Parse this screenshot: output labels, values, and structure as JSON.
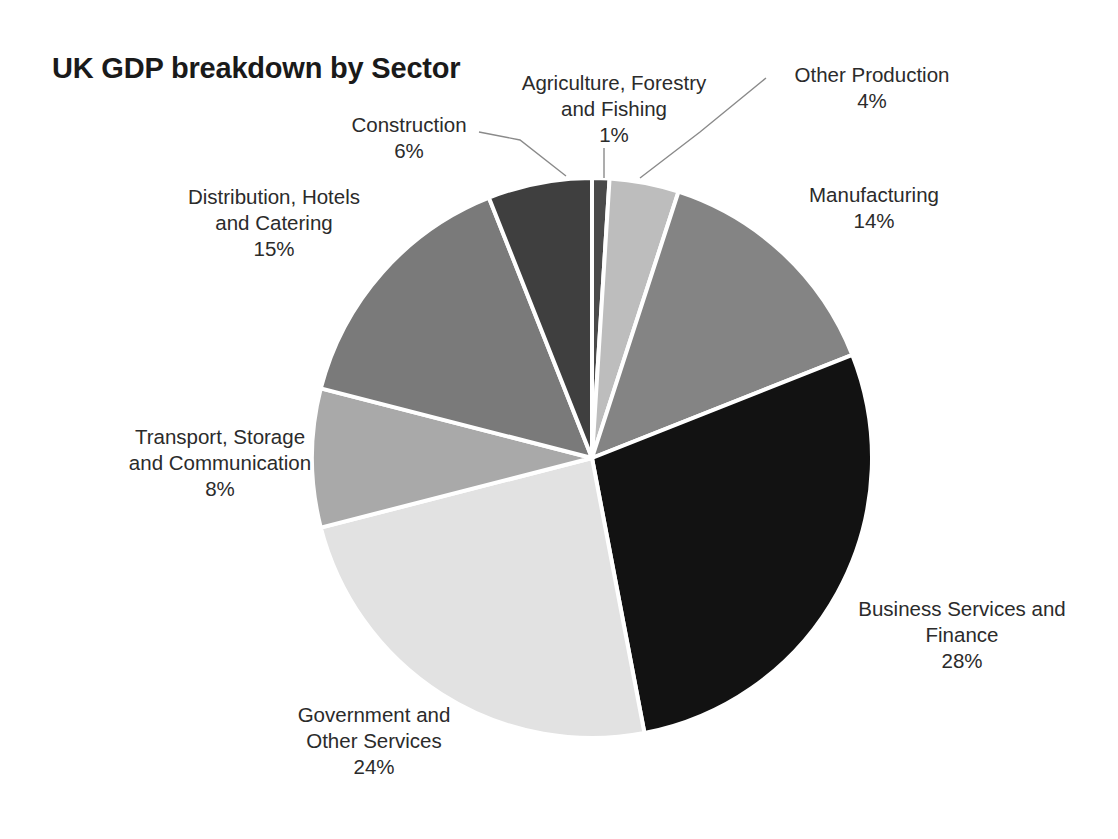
{
  "chart_data": {
    "type": "pie",
    "title": "UK GDP breakdown by Sector",
    "xlabel": "",
    "ylabel": "",
    "legend": "none",
    "grid": false,
    "units": "percent",
    "label_format": "name + percent",
    "start_angle_deg": 0,
    "direction": "clockwise",
    "center": {
      "x": 592,
      "y": 458
    },
    "radius": 280,
    "slice_gap_color": "#ffffff",
    "categories": [
      "Agriculture, Forestry and Fishing",
      "Other Production",
      "Manufacturing",
      "Business Services and Finance",
      "Government and Other Services",
      "Transport, Storage and Communication",
      "Distribution, Hotels and Catering",
      "Construction"
    ],
    "values": [
      1,
      4,
      14,
      28,
      24,
      8,
      15,
      6
    ],
    "colors": [
      "#4a4a4a",
      "#bdbdbd",
      "#848484",
      "#121212",
      "#e2e2e2",
      "#a9a9a9",
      "#7a7a7a",
      "#3f3f3f"
    ],
    "slices": [
      {
        "key": "agriculture",
        "name_line1": "Agriculture, Forestry",
        "name_line2": "and Fishing",
        "value": 1,
        "value_text": "1%",
        "color": "#4a4a4a",
        "has_leader_line": true
      },
      {
        "key": "other-production",
        "name_line1": "Other Production",
        "name_line2": "",
        "value": 4,
        "value_text": "4%",
        "color": "#bdbdbd",
        "has_leader_line": true
      },
      {
        "key": "manufacturing",
        "name_line1": "Manufacturing",
        "name_line2": "",
        "value": 14,
        "value_text": "14%",
        "color": "#848484",
        "has_leader_line": false
      },
      {
        "key": "business-services",
        "name_line1": "Business Services and",
        "name_line2": "Finance",
        "value": 28,
        "value_text": "28%",
        "color": "#121212",
        "has_leader_line": false
      },
      {
        "key": "government",
        "name_line1": "Government and",
        "name_line2": "Other Services",
        "value": 24,
        "value_text": "24%",
        "color": "#e2e2e2",
        "has_leader_line": false
      },
      {
        "key": "transport",
        "name_line1": "Transport, Storage",
        "name_line2": "and Communication",
        "value": 8,
        "value_text": "8%",
        "color": "#a9a9a9",
        "has_leader_line": false
      },
      {
        "key": "distribution",
        "name_line1": "Distribution, Hotels",
        "name_line2": "and Catering",
        "value": 15,
        "value_text": "15%",
        "color": "#7a7a7a",
        "has_leader_line": false
      },
      {
        "key": "construction",
        "name_line1": "Construction",
        "name_line2": "",
        "value": 6,
        "value_text": "6%",
        "color": "#3f3f3f",
        "has_leader_line": true
      }
    ]
  }
}
